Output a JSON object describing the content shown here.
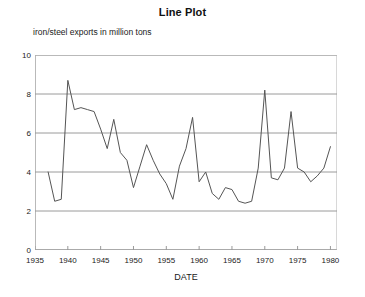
{
  "chart_data": {
    "type": "line",
    "title": "Line Plot",
    "xlabel": "DATE",
    "ylabel": "iron/steel exports in million tons",
    "ylim": [
      0,
      10
    ],
    "xlim": [
      1935,
      1981
    ],
    "grid": true,
    "legend": null,
    "y_ticks": [
      0,
      2,
      4,
      6,
      8,
      10
    ],
    "x_ticks": [
      1935,
      1940,
      1945,
      1950,
      1955,
      1960,
      1965,
      1970,
      1975,
      1980
    ],
    "series": [
      {
        "name": "iron/steel exports",
        "color": "#555555",
        "x": [
          1937,
          1938,
          1939,
          1940,
          1941,
          1942,
          1943,
          1944,
          1945,
          1946,
          1947,
          1948,
          1949,
          1950,
          1951,
          1952,
          1953,
          1954,
          1955,
          1956,
          1957,
          1958,
          1959,
          1960,
          1961,
          1962,
          1963,
          1964,
          1965,
          1966,
          1967,
          1968,
          1969,
          1970,
          1971,
          1972,
          1973,
          1974,
          1975,
          1976,
          1977,
          1978,
          1979,
          1980
        ],
        "y": [
          4.0,
          2.5,
          2.6,
          8.7,
          7.2,
          7.3,
          7.2,
          7.1,
          6.2,
          5.2,
          6.7,
          5.0,
          4.6,
          3.2,
          4.3,
          5.4,
          4.6,
          3.9,
          3.4,
          2.6,
          4.3,
          5.2,
          6.8,
          3.5,
          4.0,
          2.9,
          2.6,
          3.2,
          3.1,
          2.5,
          2.4,
          2.5,
          4.2,
          8.2,
          3.7,
          3.6,
          4.2,
          7.1,
          4.2,
          4.0,
          3.5,
          3.8,
          4.2,
          5.3
        ]
      }
    ]
  }
}
